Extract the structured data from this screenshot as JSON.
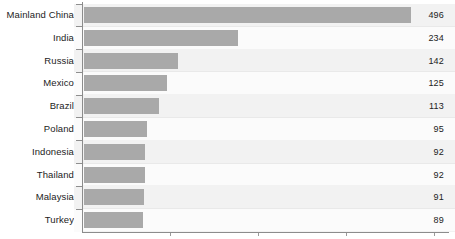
{
  "chart_data": {
    "type": "bar",
    "orientation": "horizontal",
    "title": "",
    "subtitle": "",
    "xlabel": "",
    "ylabel": "",
    "categories": [
      "Mainland China",
      "India",
      "Russia",
      "Mexico",
      "Brazil",
      "Poland",
      "Indonesia",
      "Thailand",
      "Malaysia",
      "Turkey"
    ],
    "values": [
      496,
      234,
      142,
      125,
      113,
      95,
      92,
      92,
      91,
      89
    ],
    "value_labels": [
      "496",
      "234",
      "142",
      "125",
      "113",
      "95",
      "92",
      "92",
      "91",
      "89"
    ],
    "xlim": [
      0,
      553
    ],
    "ylim": null,
    "grid": false,
    "legend": null,
    "legend_position": "none",
    "annotations": [],
    "bar_color": "#a9a9a9",
    "band_colors": [
      "#f2f2f2",
      "#fbfbfb"
    ],
    "axis_color": "#8c8c8c",
    "label_color": "#1c1c1c",
    "value_color": "#222222",
    "background": "#ffffff"
  },
  "axis": {
    "x_ticks": [
      "",
      "",
      "",
      ""
    ],
    "caption_fragment": ""
  }
}
